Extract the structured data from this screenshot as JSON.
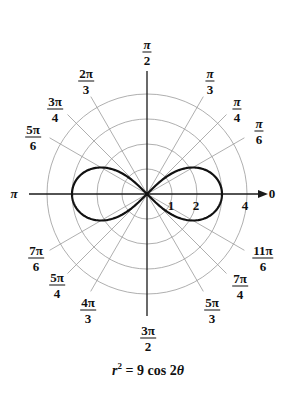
{
  "chart_data": {
    "type": "polar",
    "equation": {
      "lhs_var": "r",
      "lhs_exp": "2",
      "rhs": "= 9 cos 2",
      "rhs_var": "θ"
    },
    "curve": {
      "name": "lemniscate",
      "formula": "r^2 = 9 cos(2θ)",
      "max_r": 3,
      "tips": [
        {
          "theta": 0,
          "r": 3
        },
        {
          "theta": "π",
          "r": 3
        }
      ]
    },
    "radial_grid": {
      "circles": [
        1,
        2,
        3,
        4
      ],
      "labels": [
        {
          "value": "1",
          "r": 1
        },
        {
          "value": "2",
          "r": 2
        },
        {
          "value": "4",
          "r": 4
        }
      ],
      "ray_extent": 4.5
    },
    "angle_labels": [
      {
        "deg": 0,
        "num": "0",
        "den": ""
      },
      {
        "deg": 30,
        "num": "π",
        "den": "6"
      },
      {
        "deg": 45,
        "num": "π",
        "den": "4"
      },
      {
        "deg": 60,
        "num": "π",
        "den": "3"
      },
      {
        "deg": 90,
        "num": "π",
        "den": "2"
      },
      {
        "deg": 120,
        "num": "2π",
        "den": "3"
      },
      {
        "deg": 135,
        "num": "3π",
        "den": "4"
      },
      {
        "deg": 150,
        "num": "5π",
        "den": "6"
      },
      {
        "deg": 180,
        "num": "π",
        "den": ""
      },
      {
        "deg": 210,
        "num": "7π",
        "den": "6"
      },
      {
        "deg": 225,
        "num": "5π",
        "den": "4"
      },
      {
        "deg": 240,
        "num": "4π",
        "den": "3"
      },
      {
        "deg": 270,
        "num": "3π",
        "den": "2"
      },
      {
        "deg": 300,
        "num": "5π",
        "den": "3"
      },
      {
        "deg": 315,
        "num": "7π",
        "den": "4"
      },
      {
        "deg": 330,
        "num": "11π",
        "den": "6"
      }
    ],
    "colors": {
      "grid": "#9a9a9a",
      "axis": "#1a1a1a",
      "curve": "#111111",
      "text": "#111111"
    }
  },
  "labels": {
    "pi_0": "0",
    "pi_180": "π",
    "r1": "1",
    "r2": "2",
    "r4": "4",
    "a30": {
      "num": "π",
      "den": "6"
    },
    "a45": {
      "num": "π",
      "den": "4"
    },
    "a60": {
      "num": "π",
      "den": "3"
    },
    "a90": {
      "num": "π",
      "den": "2"
    },
    "a120": {
      "num": "2π",
      "den": "3"
    },
    "a135": {
      "num": "3π",
      "den": "4"
    },
    "a150": {
      "num": "5π",
      "den": "6"
    },
    "a210": {
      "num": "7π",
      "den": "6"
    },
    "a225": {
      "num": "5π",
      "den": "4"
    },
    "a240": {
      "num": "4π",
      "den": "3"
    },
    "a270": {
      "num": "3π",
      "den": "2"
    },
    "a300": {
      "num": "5π",
      "den": "3"
    },
    "a315": {
      "num": "7π",
      "den": "4"
    },
    "a330": {
      "num": "11π",
      "den": "6"
    }
  }
}
